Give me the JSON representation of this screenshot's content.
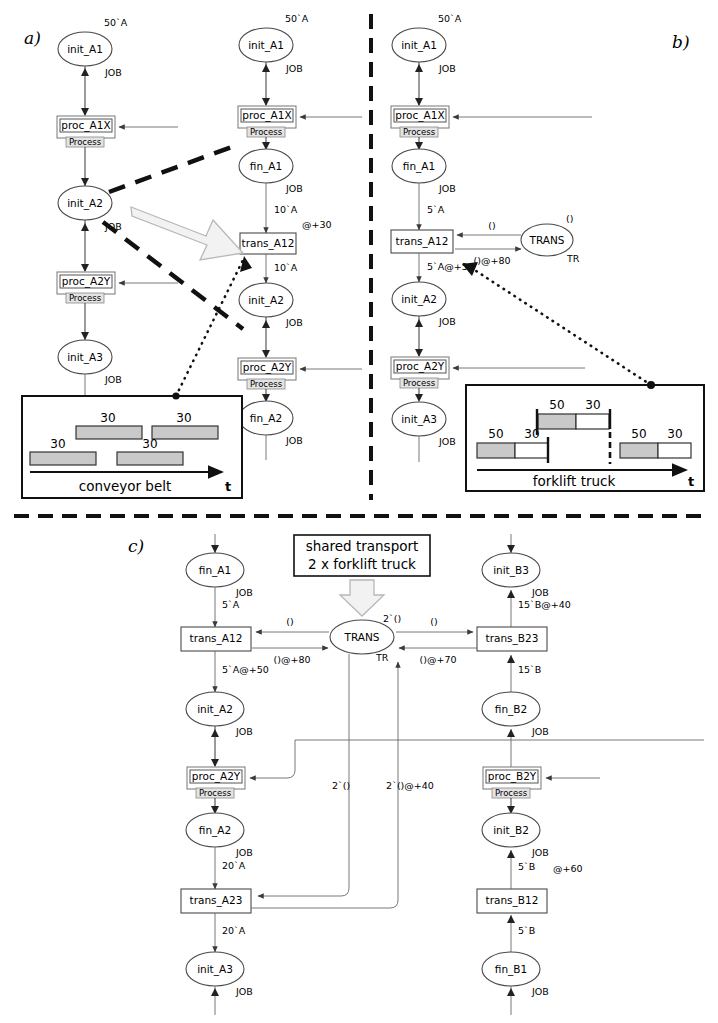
{
  "figure": {
    "panels": [
      {
        "id": "a",
        "label": "a)"
      },
      {
        "id": "b",
        "label": "b)"
      },
      {
        "id": "c",
        "label": "c)"
      }
    ]
  },
  "panel_a": {
    "left_column": {
      "places": [
        {
          "name": "init_A1",
          "type": "JOB",
          "marking": "50`A"
        },
        {
          "name": "init_A2",
          "type": "JOB",
          "marking": ""
        },
        {
          "name": "init_A3",
          "type": "JOB",
          "marking": ""
        }
      ],
      "substitutions": [
        {
          "name": "proc_A1X",
          "tag": "Process"
        },
        {
          "name": "proc_A2Y",
          "tag": "Process"
        }
      ]
    },
    "right_column": {
      "places": [
        {
          "name": "init_A1",
          "type": "JOB",
          "marking": "50`A"
        },
        {
          "name": "fin_A1",
          "type": "JOB",
          "marking": ""
        },
        {
          "name": "init_A2",
          "type": "JOB",
          "marking": ""
        },
        {
          "name": "fin_A2",
          "type": "JOB",
          "marking": ""
        }
      ],
      "substitutions": [
        {
          "name": "proc_A1X",
          "tag": "Process"
        },
        {
          "name": "proc_A2Y",
          "tag": "Process"
        }
      ],
      "transitions": [
        {
          "name": "trans_A12",
          "delay": "@+30",
          "in_arc": "10`A",
          "out_arc": "10`A"
        }
      ]
    },
    "timing_box": {
      "title": "conveyor belt",
      "axis_label": "t",
      "bars": [
        {
          "label": "30",
          "row": "top",
          "fill": "gray"
        },
        {
          "label": "30",
          "row": "top",
          "fill": "gray"
        },
        {
          "label": "30",
          "row": "bottom",
          "fill": "gray"
        },
        {
          "label": "30",
          "row": "bottom",
          "fill": "gray"
        }
      ]
    }
  },
  "panel_b": {
    "column": {
      "places": [
        {
          "name": "init_A1",
          "type": "JOB",
          "marking": "50`A"
        },
        {
          "name": "fin_A1",
          "type": "JOB",
          "marking": ""
        },
        {
          "name": "init_A2",
          "type": "JOB",
          "marking": ""
        },
        {
          "name": "init_A3",
          "type": "JOB",
          "marking": ""
        }
      ],
      "substitutions": [
        {
          "name": "proc_A1X",
          "tag": "Process"
        },
        {
          "name": "proc_A2Y",
          "tag": "Process"
        }
      ],
      "transitions": [
        {
          "name": "trans_A12",
          "in_arc": "5`A",
          "out_arc": "5`A@+50"
        }
      ],
      "resource": {
        "name": "TRANS",
        "type": "TR",
        "marking": "()",
        "in_arc": "()",
        "out_arc": "()@+80"
      }
    },
    "timing_box": {
      "title": "forklift truck",
      "axis_label": "t",
      "bars": [
        {
          "busy": "50",
          "idle": "30"
        },
        {
          "busy": "50",
          "idle": "30"
        },
        {
          "busy": "50",
          "idle": "30"
        }
      ]
    }
  },
  "panel_c": {
    "note": {
      "line1": "shared transport",
      "line2": "2 x forklift truck"
    },
    "resource": {
      "name": "TRANS",
      "type": "TR",
      "marking": "2`()"
    },
    "left_column": {
      "places": [
        {
          "name": "fin_A1",
          "type": "JOB"
        },
        {
          "name": "init_A2",
          "type": "JOB"
        },
        {
          "name": "fin_A2",
          "type": "JOB"
        },
        {
          "name": "init_A3",
          "type": "JOB"
        }
      ],
      "substitutions": [
        {
          "name": "proc_A2Y",
          "tag": "Process"
        }
      ],
      "transitions": [
        {
          "name": "trans_A12",
          "in_arc": "5`A",
          "out_arc": "5`A@+50",
          "res_in": "()",
          "res_out": "()@+80"
        },
        {
          "name": "trans_A23",
          "in_arc": "20`A",
          "out_arc": "20`A",
          "res_in": "2`()",
          "res_out": "2`()@+40"
        }
      ]
    },
    "right_column": {
      "places": [
        {
          "name": "init_B3",
          "type": "JOB"
        },
        {
          "name": "fin_B2",
          "type": "JOB"
        },
        {
          "name": "init_B2",
          "type": "JOB"
        },
        {
          "name": "fin_B1",
          "type": "JOB"
        }
      ],
      "substitutions": [
        {
          "name": "proc_B2Y",
          "tag": "Process"
        }
      ],
      "transitions": [
        {
          "name": "trans_B23",
          "in_arc": "15`B",
          "out_arc": "15`B@+40",
          "res_in": "()",
          "res_out": "()@+70"
        },
        {
          "name": "trans_B12",
          "in_arc": "5`B",
          "out_arc": "5`B",
          "delay": "@+60"
        }
      ]
    }
  },
  "colors": {
    "stroke": "#4a4a4a",
    "bar_fill": "#c9c9c9",
    "accent_arrow": "#f2f2f2",
    "separator": "#111111"
  }
}
